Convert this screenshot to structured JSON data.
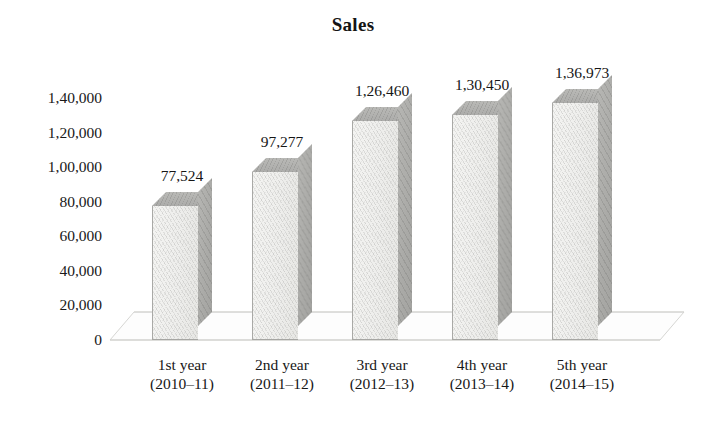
{
  "chart": {
    "title": "Sales",
    "type": "bar-3d"
  },
  "y_axis": {
    "ticks": [
      "1,40,000",
      "1,20,000",
      "1,00,000",
      "80,000",
      "60,000",
      "40,000",
      "20,000",
      "0"
    ]
  },
  "bars": [
    {
      "label": "77,524",
      "value": 77524,
      "cat_line1": "1st year",
      "cat_line2": "(2010–11)"
    },
    {
      "label": "97,277",
      "value": 97277,
      "cat_line1": "2nd year",
      "cat_line2": "(2011–12)"
    },
    {
      "label": "1,26,460",
      "value": 126460,
      "cat_line1": "3rd year",
      "cat_line2": "(2012–13)"
    },
    {
      "label": "1,30,450",
      "value": 130450,
      "cat_line1": "4th year",
      "cat_line2": "(2013–14)"
    },
    {
      "label": "1,36,973",
      "value": 136973,
      "cat_line1": "5th year",
      "cat_line2": "(2014–15)"
    }
  ],
  "chart_data": {
    "type": "bar",
    "title": "Sales",
    "subtitle": "",
    "xlabel": "",
    "ylabel": "",
    "categories": [
      "1st year (2010–11)",
      "2nd year (2011–12)",
      "3rd year (2012–13)",
      "4th year (2013–14)",
      "5th year (2014–15)"
    ],
    "values": [
      77524,
      97277,
      126460,
      130450,
      136973
    ],
    "data_labels": [
      "77,524",
      "97,277",
      "1,26,460",
      "1,30,450",
      "1,36,973"
    ],
    "ylim": [
      0,
      140000
    ],
    "ytick_values": [
      0,
      20000,
      40000,
      60000,
      80000,
      100000,
      120000,
      140000
    ],
    "ytick_labels": [
      "0",
      "20,000",
      "40,000",
      "60,000",
      "80,000",
      "1,00,000",
      "1,20,000",
      "1,40,000"
    ],
    "number_format": "indian",
    "grid": false,
    "legend": false,
    "legend_position": "none",
    "bar_face_color": "#eeeeec",
    "bar_side_color": "#acacaa",
    "bar_top_color": "#b2b2b0",
    "background_color": "#ffffff",
    "text_color": "#1b1b1b"
  }
}
